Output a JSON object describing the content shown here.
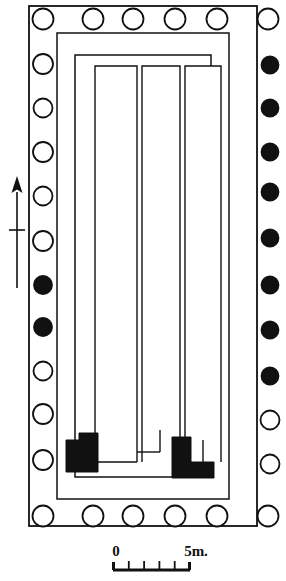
{
  "figure": {
    "type": "archaeological-floor-plan"
  },
  "orientation": {
    "name": "north-arrow",
    "direction": "up",
    "has_crossbar": true
  },
  "scale_bar": {
    "start_label": "0",
    "end_label": "5m.",
    "divisions": 5,
    "tick_count": 4
  },
  "colonnade": {
    "open_marker_color": "#ffffff",
    "filled_marker_color": "#111111",
    "stroke_color": "#111111",
    "top_row": [
      {
        "state": "open"
      },
      {
        "state": "open"
      },
      {
        "state": "open"
      },
      {
        "state": "open"
      },
      {
        "state": "open"
      },
      {
        "state": "open"
      }
    ],
    "bottom_row": [
      {
        "state": "open"
      },
      {
        "state": "open"
      },
      {
        "state": "open"
      },
      {
        "state": "open"
      },
      {
        "state": "open"
      },
      {
        "state": "open"
      }
    ],
    "left_column": [
      {
        "state": "open"
      },
      {
        "state": "open"
      },
      {
        "state": "open"
      },
      {
        "state": "open"
      },
      {
        "state": "open"
      },
      {
        "state": "open"
      },
      {
        "state": "filled"
      },
      {
        "state": "filled"
      },
      {
        "state": "open"
      },
      {
        "state": "open"
      },
      {
        "state": "open"
      }
    ],
    "right_column": [
      {
        "state": "filled"
      },
      {
        "state": "filled"
      },
      {
        "state": "filled"
      },
      {
        "state": "filled"
      },
      {
        "state": "filled"
      },
      {
        "state": "filled"
      },
      {
        "state": "filled"
      },
      {
        "state": "filled"
      },
      {
        "state": "open"
      },
      {
        "state": "open"
      },
      {
        "state": "open"
      }
    ]
  },
  "walls": {
    "stroke_color": "#111111",
    "fill_color": "#ffffff",
    "outer_enclosure": {
      "x": 29,
      "y": 6,
      "w": 228,
      "h": 520
    },
    "peristyle_wall": {
      "x": 57,
      "y": 33,
      "w": 172,
      "h": 466
    },
    "cella_outer": {
      "x": 75,
      "y": 55,
      "w": 136,
      "h": 422
    }
  },
  "compartments": {
    "stroke_color": "#111111",
    "items": [
      {
        "label": "west-chamber",
        "x": 95,
        "y": 66,
        "w": 42,
        "h": 395
      },
      {
        "label": "central-chamber",
        "x": 142,
        "y": 66,
        "w": 38,
        "h": 395
      },
      {
        "label": "east-chamber",
        "x": 185,
        "y": 66,
        "w": 36,
        "h": 395
      }
    ]
  },
  "masonry_blocks": {
    "fill_color": "#111111",
    "items": [
      {
        "label": "west-black-block"
      },
      {
        "label": "east-black-block"
      }
    ]
  }
}
